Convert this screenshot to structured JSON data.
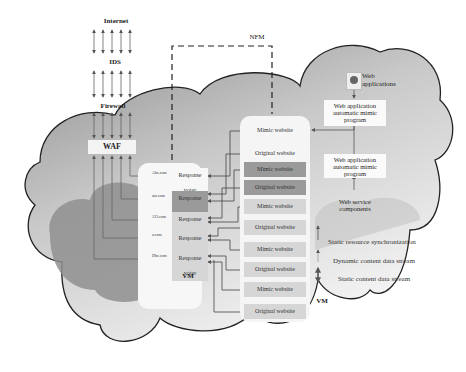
{
  "title": "NFM",
  "top_chain": [
    {
      "label": "Internet"
    },
    {
      "label": "IDS"
    },
    {
      "label": "Firewall"
    },
    {
      "label": "WAF"
    }
  ],
  "vm_left": {
    "label": "VM",
    "voters": [
      {
        "domain": "Abc.com",
        "label": "Response voter",
        "shade": "#f7f7f7"
      },
      {
        "domain": "ass.com",
        "label": "Response voter",
        "shade": "#9a9a9a"
      },
      {
        "domain": "123.com",
        "label": "Response voter",
        "shade": "#d6d6d6"
      },
      {
        "domain": "a.com",
        "label": "Response voter",
        "shade": "#d6d6d6"
      },
      {
        "domain": "Dbc.com",
        "label": "Response voter",
        "shade": "#d6d6d6"
      }
    ]
  },
  "vm_right": {
    "label": "VM",
    "sites": [
      {
        "label": "Mimic website",
        "shade": "#f5f5f5"
      },
      {
        "label": "Original website",
        "shade": "#f5f5f5"
      },
      {
        "label": "Mimic website",
        "shade": "#9a9a9a"
      },
      {
        "label": "Original website",
        "shade": "#9a9a9a"
      },
      {
        "label": "Mimic website",
        "shade": "#d6d6d6"
      },
      {
        "label": "Original website",
        "shade": "#d6d6d6"
      },
      {
        "label": "Mimic website",
        "shade": "#d6d6d6"
      },
      {
        "label": "Original website",
        "shade": "#d6d6d6"
      },
      {
        "label": "Mimic website",
        "shade": "#d6d6d6"
      },
      {
        "label": "Original website",
        "shade": "#d6d6d6"
      }
    ]
  },
  "right_side": {
    "web_applications": "Web applications",
    "mimic_program_1": "Web application automatic mimic program",
    "mimic_program_2": "Web application automatic mimic program",
    "web_service_components": "Web service components"
  },
  "legend": [
    {
      "icon": "up-arrow-icon",
      "label": "Static resource synchronization"
    },
    {
      "icon": "left-arrow-icon",
      "label": "Dynamic content data stream"
    },
    {
      "icon": "double-arrow-icon",
      "label": "Static content data stream"
    }
  ]
}
